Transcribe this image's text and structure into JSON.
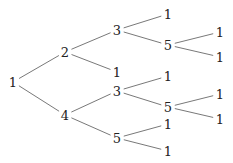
{
  "tree": {
    "nodes": [
      {
        "id": "n0",
        "label": "1",
        "x": 13,
        "y": 82
      },
      {
        "id": "n1",
        "label": "2",
        "x": 65,
        "y": 52
      },
      {
        "id": "n2",
        "label": "4",
        "x": 65,
        "y": 115
      },
      {
        "id": "n3",
        "label": "3",
        "x": 117,
        "y": 30
      },
      {
        "id": "n4",
        "label": "1",
        "x": 117,
        "y": 72
      },
      {
        "id": "n5",
        "label": "3",
        "x": 117,
        "y": 91
      },
      {
        "id": "n6",
        "label": "5",
        "x": 117,
        "y": 138
      },
      {
        "id": "n7",
        "label": "1",
        "x": 168,
        "y": 14
      },
      {
        "id": "n8",
        "label": "5",
        "x": 168,
        "y": 45
      },
      {
        "id": "n9",
        "label": "1",
        "x": 168,
        "y": 76
      },
      {
        "id": "n10",
        "label": "5",
        "x": 168,
        "y": 107
      },
      {
        "id": "n11",
        "label": "1",
        "x": 168,
        "y": 124
      },
      {
        "id": "n12",
        "label": "1",
        "x": 168,
        "y": 151
      },
      {
        "id": "n13",
        "label": "1",
        "x": 220,
        "y": 32
      },
      {
        "id": "n14",
        "label": "1",
        "x": 220,
        "y": 57
      },
      {
        "id": "n15",
        "label": "1",
        "x": 220,
        "y": 94
      },
      {
        "id": "n16",
        "label": "1",
        "x": 220,
        "y": 119
      }
    ],
    "edges": [
      [
        "n0",
        "n1"
      ],
      [
        "n0",
        "n2"
      ],
      [
        "n1",
        "n3"
      ],
      [
        "n1",
        "n4"
      ],
      [
        "n2",
        "n5"
      ],
      [
        "n2",
        "n6"
      ],
      [
        "n3",
        "n7"
      ],
      [
        "n3",
        "n8"
      ],
      [
        "n5",
        "n9"
      ],
      [
        "n5",
        "n10"
      ],
      [
        "n6",
        "n11"
      ],
      [
        "n6",
        "n12"
      ],
      [
        "n8",
        "n13"
      ],
      [
        "n8",
        "n14"
      ],
      [
        "n10",
        "n15"
      ],
      [
        "n10",
        "n16"
      ]
    ]
  }
}
